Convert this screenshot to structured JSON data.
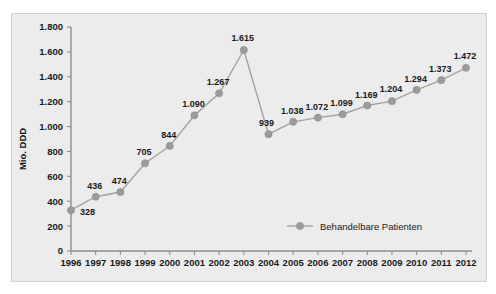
{
  "chart_data": {
    "type": "line",
    "title": "",
    "xlabel": "",
    "ylabel": "Mio. DDD",
    "ylim": [
      0,
      1800
    ],
    "ytick_step": 200,
    "grid": false,
    "legend_position": "inside-bottom-center",
    "categories": [
      "1996",
      "1997",
      "1998",
      "1999",
      "2000",
      "2001",
      "2002",
      "2003",
      "2004",
      "2005",
      "2006",
      "2007",
      "2008",
      "2009",
      "2010",
      "2011",
      "2012"
    ],
    "ytick_labels": [
      "0",
      "200",
      "400",
      "600",
      "800",
      "1.000",
      "1.200",
      "1.400",
      "1.600",
      "1.800"
    ],
    "ytick_values": [
      0,
      200,
      400,
      600,
      800,
      1000,
      1200,
      1400,
      1600,
      1800
    ],
    "series": [
      {
        "name": "Behandelbare Patienten",
        "color": "#9b9b9b",
        "values": [
          328,
          436,
          474,
          705,
          844,
          1090,
          1267,
          1615,
          939,
          1038,
          1072,
          1099,
          1169,
          1204,
          1294,
          1373,
          1472
        ],
        "point_labels": [
          "328",
          "436",
          "474",
          "705",
          "844",
          "1.090",
          "1.267",
          "1.615",
          "939",
          "1.038",
          "1.072",
          "1.099",
          "1.169",
          "1.204",
          "1.294",
          "1.373",
          "1.472"
        ]
      }
    ],
    "legend": [
      {
        "label": "Behandelbare Patienten",
        "color": "#9b9b9b",
        "marker": "circle"
      }
    ]
  },
  "colors": {
    "plot_background": "#ececec",
    "frame_border": "#d2d2d2",
    "axis": "#8e8e8e",
    "series": "#9b9b9b",
    "text": "#1a1a1a",
    "page_background": "#ffffff"
  }
}
